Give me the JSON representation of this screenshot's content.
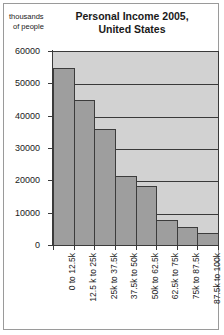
{
  "chart_data": {
    "type": "bar",
    "title": "Personal Income 2005, United States",
    "title_lines": [
      "Personal Income 2005,",
      "United States"
    ],
    "ylabel": "thousands of people",
    "ylabel_lines": [
      "thousands",
      "of people"
    ],
    "xlabel": "",
    "categories": [
      "0 to 12.5k",
      "12.5 k to 25k",
      "25k to 37.5k",
      "37.5k to 50k",
      "50k to 62.5k",
      "62.5k to 75k",
      "75k to 87.5k",
      "87.5k to 100k"
    ],
    "values": [
      55000,
      45200,
      36200,
      21700,
      18600,
      8200,
      6000,
      4100
    ],
    "ylim": [
      0,
      60000
    ],
    "yticks": [
      0,
      10000,
      20000,
      30000,
      40000,
      50000,
      60000
    ],
    "ytick_labels": [
      "0",
      "10000",
      "20000",
      "30000",
      "40000",
      "50000",
      "60000"
    ],
    "grid": true,
    "legend": "none",
    "colors": {
      "bar_fill": "#9e9e9e",
      "bar_edge": "#3c3c3c",
      "plot_background": "#d2d2d2",
      "gridline": "#3a3a3a",
      "frame": "#9a9a9a",
      "text": "#1a1a1a"
    }
  }
}
